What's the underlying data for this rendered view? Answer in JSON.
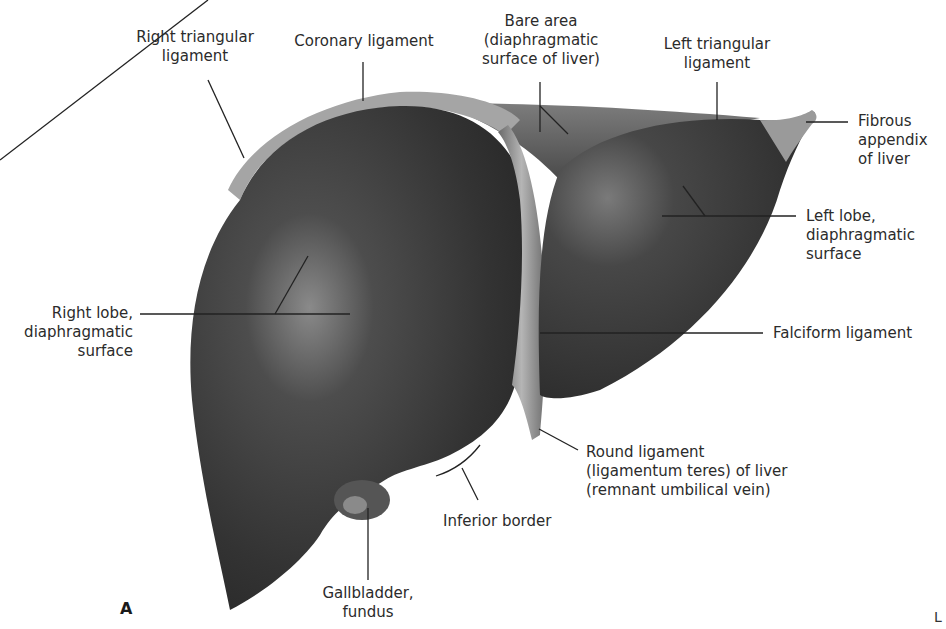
{
  "figure": {
    "panel_letter": "A",
    "orientation_marker": "L",
    "labels": {
      "right_triangular_ligament": [
        "Right triangular",
        "ligament"
      ],
      "coronary_ligament": [
        "Coronary ligament"
      ],
      "bare_area": [
        "Bare area",
        "(diaphragmatic",
        "surface of liver)"
      ],
      "left_triangular_ligament": [
        "Left triangular",
        "ligament"
      ],
      "fibrous_appendix": [
        "Fibrous",
        "appendix",
        "of liver"
      ],
      "left_lobe": [
        "Left lobe,",
        "diaphragmatic",
        "surface"
      ],
      "right_lobe": [
        "Right lobe,",
        "diaphragmatic",
        "surface"
      ],
      "falciform_ligament": [
        "Falciform ligament"
      ],
      "round_ligament": [
        "Round ligament",
        "(ligamentum teres) of liver",
        "(remnant umbilical vein)"
      ],
      "inferior_border": [
        "Inferior border"
      ],
      "gallbladder_fundus": [
        "Gallbladder,",
        "fundus"
      ]
    },
    "colors": {
      "liver_dark": "#2e2e2e",
      "liver_mid": "#5a5a5a",
      "ligament": "#a8a8a8",
      "leader_line": "#222222"
    }
  }
}
